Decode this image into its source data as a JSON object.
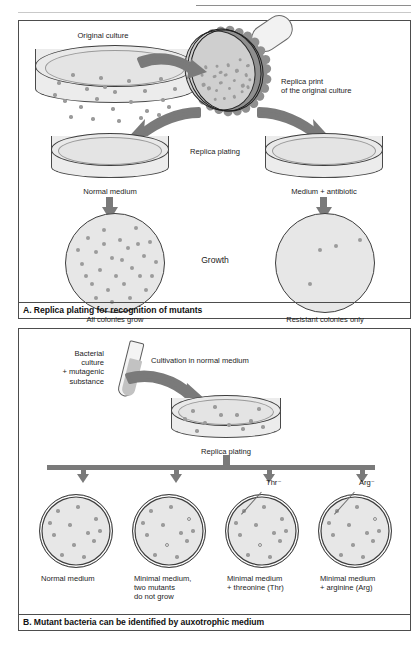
{
  "running_head": {
    "title": "Isolation of Mutant Bacteria",
    "page": "93"
  },
  "panel_a": {
    "caption": "A. Replica plating for recognition of mutants",
    "labels": {
      "original_culture": "Original culture",
      "replica_print": "Replica print\nof the original culture",
      "replica_plating": "Replica plating",
      "normal_medium": "Normal medium",
      "medium_antibiotic": "Medium + antibiotic",
      "growth": "Growth",
      "all_colonies_grow": "All colonies grow",
      "resistant_only": "Resistant colonies only"
    },
    "dishes": {
      "original": {
        "colonies": [
          [
            24,
            38
          ],
          [
            38,
            30
          ],
          [
            52,
            44
          ],
          [
            66,
            33
          ],
          [
            80,
            47
          ],
          [
            94,
            36
          ],
          [
            110,
            46
          ],
          [
            126,
            34
          ],
          [
            30,
            56
          ],
          [
            46,
            62
          ],
          [
            62,
            54
          ],
          [
            78,
            64
          ],
          [
            96,
            57
          ],
          [
            112,
            66
          ],
          [
            128,
            55
          ],
          [
            140,
            44
          ],
          [
            36,
            72
          ],
          [
            58,
            74
          ],
          [
            84,
            76
          ],
          [
            106,
            73
          ],
          [
            124,
            70
          ],
          [
            20,
            50
          ],
          [
            70,
            42
          ],
          [
            134,
            62
          ]
        ]
      },
      "all_grow": {
        "colonies": [
          [
            22,
            24
          ],
          [
            38,
            16
          ],
          [
            54,
            26
          ],
          [
            70,
            14
          ],
          [
            30,
            38
          ],
          [
            46,
            44
          ],
          [
            62,
            34
          ],
          [
            78,
            42
          ],
          [
            16,
            50
          ],
          [
            34,
            56
          ],
          [
            50,
            62
          ],
          [
            66,
            54
          ],
          [
            26,
            70
          ],
          [
            42,
            76
          ],
          [
            58,
            70
          ],
          [
            74,
            62
          ],
          [
            12,
            36
          ],
          [
            84,
            28
          ],
          [
            90,
            48
          ],
          [
            80,
            76
          ],
          [
            64,
            84
          ],
          [
            46,
            88
          ],
          [
            30,
            84
          ],
          [
            20,
            62
          ],
          [
            56,
            46
          ],
          [
            72,
            30
          ],
          [
            38,
            30
          ],
          [
            86,
            62
          ]
        ]
      },
      "resistant": {
        "colonies": [
          [
            44,
            36
          ],
          [
            60,
            32
          ],
          [
            84,
            26
          ],
          [
            34,
            70
          ]
        ]
      }
    }
  },
  "panel_b": {
    "caption": "B. Mutant bacteria can be identified by auxotrophic medium",
    "labels": {
      "bacterial_culture": "Bacterial\nculture\n+ mutagenic\nsubstance",
      "cultivation": "Cultivation in normal medium",
      "replica_plating": "Replica plating",
      "thr_marker": "Thr⁻",
      "arg_marker": "Arg⁻"
    },
    "top_dish": {
      "colonies": [
        [
          22,
          16
        ],
        [
          44,
          12
        ],
        [
          66,
          20
        ],
        [
          88,
          14
        ],
        [
          34,
          28
        ],
        [
          58,
          30
        ],
        [
          80,
          26
        ],
        [
          14,
          24
        ],
        [
          50,
          20
        ],
        [
          72,
          34
        ],
        [
          26,
          36
        ],
        [
          92,
          32
        ]
      ]
    },
    "dishes": [
      {
        "label": "Normal medium",
        "colonies": [
          {
            "x": 18,
            "y": 16,
            "open": false
          },
          {
            "x": 38,
            "y": 12,
            "open": false
          },
          {
            "x": 56,
            "y": 24,
            "open": false
          },
          {
            "x": 30,
            "y": 30,
            "open": false
          },
          {
            "x": 48,
            "y": 38,
            "open": false
          },
          {
            "x": 14,
            "y": 40,
            "open": false
          },
          {
            "x": 34,
            "y": 50,
            "open": false
          },
          {
            "x": 54,
            "y": 46,
            "open": false
          },
          {
            "x": 22,
            "y": 60,
            "open": false
          },
          {
            "x": 44,
            "y": 62,
            "open": false
          },
          {
            "x": 60,
            "y": 36,
            "open": false
          },
          {
            "x": 10,
            "y": 28,
            "open": false
          }
        ]
      },
      {
        "label": "Minimal medium,\ntwo mutants\ndo not grow",
        "colonies": [
          {
            "x": 18,
            "y": 16,
            "open": false
          },
          {
            "x": 38,
            "y": 12,
            "open": false
          },
          {
            "x": 56,
            "y": 24,
            "open": true
          },
          {
            "x": 30,
            "y": 30,
            "open": false
          },
          {
            "x": 48,
            "y": 38,
            "open": false
          },
          {
            "x": 14,
            "y": 40,
            "open": false
          },
          {
            "x": 34,
            "y": 50,
            "open": true
          },
          {
            "x": 54,
            "y": 46,
            "open": false
          },
          {
            "x": 22,
            "y": 60,
            "open": false
          },
          {
            "x": 44,
            "y": 62,
            "open": false
          },
          {
            "x": 60,
            "y": 36,
            "open": false
          },
          {
            "x": 10,
            "y": 28,
            "open": false
          }
        ]
      },
      {
        "label": "Minimal medium\n+ threonine (Thr)",
        "colonies": [
          {
            "x": 18,
            "y": 16,
            "open": false
          },
          {
            "x": 38,
            "y": 12,
            "open": false
          },
          {
            "x": 56,
            "y": 24,
            "open": false
          },
          {
            "x": 30,
            "y": 30,
            "open": false
          },
          {
            "x": 48,
            "y": 38,
            "open": false
          },
          {
            "x": 14,
            "y": 40,
            "open": false
          },
          {
            "x": 34,
            "y": 50,
            "open": true
          },
          {
            "x": 54,
            "y": 46,
            "open": false
          },
          {
            "x": 22,
            "y": 60,
            "open": false
          },
          {
            "x": 44,
            "y": 62,
            "open": false
          },
          {
            "x": 60,
            "y": 36,
            "open": false
          },
          {
            "x": 10,
            "y": 28,
            "open": false
          }
        ]
      },
      {
        "label": "Minimal medium\n+ arginine (Arg)",
        "colonies": [
          {
            "x": 18,
            "y": 16,
            "open": false
          },
          {
            "x": 38,
            "y": 12,
            "open": false
          },
          {
            "x": 56,
            "y": 24,
            "open": true
          },
          {
            "x": 30,
            "y": 30,
            "open": false
          },
          {
            "x": 48,
            "y": 38,
            "open": false
          },
          {
            "x": 14,
            "y": 40,
            "open": false
          },
          {
            "x": 34,
            "y": 50,
            "open": false
          },
          {
            "x": 54,
            "y": 46,
            "open": false
          },
          {
            "x": 22,
            "y": 60,
            "open": false
          },
          {
            "x": 44,
            "y": 62,
            "open": false
          },
          {
            "x": 60,
            "y": 36,
            "open": false
          },
          {
            "x": 10,
            "y": 28,
            "open": false
          }
        ]
      }
    ]
  },
  "colors": {
    "colony": "#9b9b9b",
    "agar": "#e7e7e7",
    "arrow": "#7a7a7a",
    "border": "#4d4d4d"
  }
}
